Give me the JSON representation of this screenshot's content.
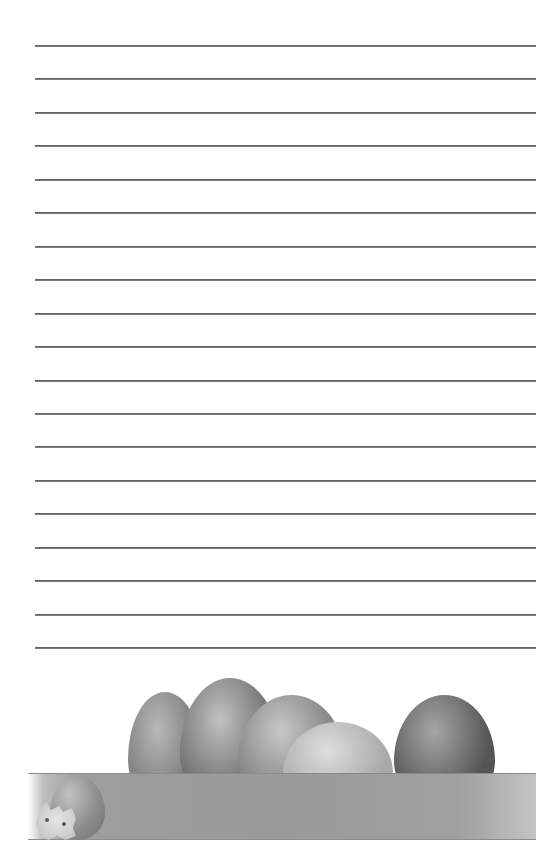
{
  "document": {
    "type": "lined notepaper",
    "rule_count": 19,
    "rule_start_y": 45,
    "rule_spacing": 33.45,
    "rule_color": "#666666",
    "background_color": "#ffffff"
  },
  "decoration": {
    "theme": "easter-eggs",
    "band_color": "#9c9c9c",
    "eggs": [
      {
        "name": "egg-1",
        "left": 128,
        "top": 32,
        "width": 74,
        "height": 86,
        "shade": "#7a7a7a",
        "highlight": "#b8b8b8"
      },
      {
        "name": "egg-2",
        "left": 180,
        "top": 18,
        "width": 100,
        "height": 100,
        "shade": "#6a6a6a",
        "highlight": "#c0c0c0"
      },
      {
        "name": "egg-3",
        "left": 238,
        "top": 35,
        "width": 107,
        "height": 84,
        "shade": "#7c7c7c",
        "highlight": "#c8c8c8"
      },
      {
        "name": "egg-4",
        "left": 283,
        "top": 62,
        "width": 110,
        "height": 58,
        "shade": "#a8a8a8",
        "highlight": "#dedede"
      },
      {
        "name": "egg-5",
        "left": 394,
        "top": 35,
        "width": 101,
        "height": 84,
        "shade": "#555555",
        "highlight": "#a6a6a6"
      }
    ]
  }
}
